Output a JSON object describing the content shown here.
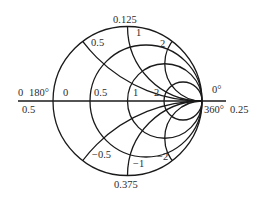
{
  "diagram": {
    "type": "smith-chart",
    "colors": {
      "line": "#1a1a1a",
      "text": "#2b2b2b",
      "background": "#ffffff"
    },
    "labels": {
      "top_wavelength": "0.125",
      "bottom_wavelength": "0.375",
      "right_wavelength": "0.25",
      "left_wavelength": "0.5",
      "left_zero": "0",
      "left_angle": "180°",
      "right_angle_top": "0°",
      "right_angle_bottom": "360°",
      "resistance": {
        "r0": "0",
        "r05": "0.5",
        "r1": "1",
        "r2": "2"
      },
      "reactance": {
        "x05_pos": "0.5",
        "x1_pos": "1",
        "x2_pos": "2",
        "x05_neg": "−0.5",
        "x1_neg": "−1",
        "x2_neg": "−2"
      }
    }
  }
}
